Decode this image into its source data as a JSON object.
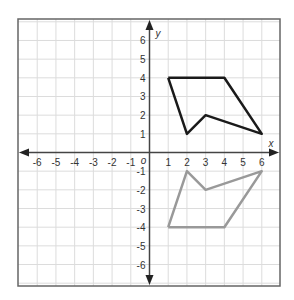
{
  "chart_data": {
    "type": "scatter",
    "title": "",
    "xlabel": "x",
    "ylabel": "y",
    "origin_label": "o",
    "xlim": [
      -7,
      7
    ],
    "ylim": [
      -7,
      7
    ],
    "grid": true,
    "x_ticks": [
      -6,
      -5,
      -4,
      -3,
      -2,
      -1,
      1,
      2,
      3,
      4,
      5,
      6
    ],
    "y_ticks": [
      6,
      5,
      4,
      3,
      2,
      1,
      -1,
      -2,
      -3,
      -4,
      -5,
      -6
    ],
    "series": [
      {
        "name": "original-figure",
        "color": "#1a1a1a",
        "points": [
          [
            1,
            4
          ],
          [
            4,
            4
          ],
          [
            6,
            1
          ],
          [
            3,
            2
          ],
          [
            2,
            1
          ],
          [
            1,
            4
          ]
        ]
      },
      {
        "name": "reflected-figure",
        "color": "#999999",
        "points": [
          [
            1,
            -4
          ],
          [
            4,
            -4
          ],
          [
            6,
            -1
          ],
          [
            3,
            -2
          ],
          [
            2,
            -1
          ],
          [
            1,
            -4
          ]
        ]
      }
    ]
  }
}
